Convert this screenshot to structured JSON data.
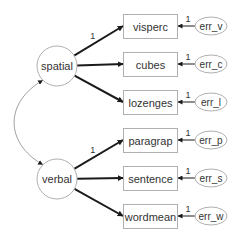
{
  "diagram": {
    "type": "structural-equation-model",
    "colors": {
      "node_stroke": "#b0b0b0",
      "arrow": "#1a1a1a",
      "text": "#333333",
      "covariance": "#888888"
    },
    "latent": [
      {
        "id": "spatial",
        "label": "spatial",
        "cx": 57,
        "cy": 66,
        "r": 20
      },
      {
        "id": "verbal",
        "label": "verbal",
        "cx": 57,
        "cy": 179,
        "r": 20
      }
    ],
    "observed": [
      {
        "id": "visperc",
        "label": "visperc",
        "factor": "spatial",
        "x": 123,
        "y": 14,
        "w": 54,
        "h": 24,
        "loading_label": "1"
      },
      {
        "id": "cubes",
        "label": "cubes",
        "factor": "spatial",
        "x": 123,
        "y": 52,
        "w": 54,
        "h": 24,
        "loading_label": ""
      },
      {
        "id": "lozenges",
        "label": "lozenges",
        "factor": "spatial",
        "x": 123,
        "y": 90,
        "w": 54,
        "h": 24,
        "loading_label": ""
      },
      {
        "id": "paragrap",
        "label": "paragrap",
        "factor": "verbal",
        "x": 123,
        "y": 128,
        "w": 54,
        "h": 24,
        "loading_label": "1"
      },
      {
        "id": "sentence",
        "label": "sentence",
        "factor": "verbal",
        "x": 123,
        "y": 166,
        "w": 54,
        "h": 24,
        "loading_label": ""
      },
      {
        "id": "wordmean",
        "label": "wordmean",
        "factor": "verbal",
        "x": 123,
        "y": 204,
        "w": 54,
        "h": 24,
        "loading_label": ""
      }
    ],
    "errors": [
      {
        "id": "err_v",
        "label": "err_v",
        "target": "visperc",
        "cx": 211,
        "cy": 26,
        "rx": 16,
        "ry": 9,
        "weight_label": "1"
      },
      {
        "id": "err_c",
        "label": "err_c",
        "target": "cubes",
        "cx": 211,
        "cy": 64,
        "rx": 16,
        "ry": 9,
        "weight_label": "1"
      },
      {
        "id": "err_l",
        "label": "err_l",
        "target": "lozenges",
        "cx": 211,
        "cy": 102,
        "rx": 16,
        "ry": 9,
        "weight_label": "1"
      },
      {
        "id": "err_p",
        "label": "err_p",
        "target": "paragrap",
        "cx": 211,
        "cy": 140,
        "rx": 16,
        "ry": 9,
        "weight_label": "1"
      },
      {
        "id": "err_s",
        "label": "err_s",
        "target": "sentence",
        "cx": 211,
        "cy": 178,
        "rx": 16,
        "ry": 9,
        "weight_label": "1"
      },
      {
        "id": "err_w",
        "label": "err_w",
        "target": "wordmean",
        "cx": 211,
        "cy": 216,
        "rx": 16,
        "ry": 9,
        "weight_label": "1"
      }
    ],
    "covariances": [
      {
        "from": "spatial",
        "to": "verbal",
        "label": ""
      }
    ]
  }
}
